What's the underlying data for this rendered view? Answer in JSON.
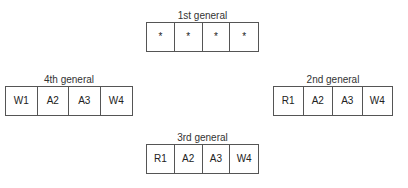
{
  "generals": [
    {
      "label": "1st general",
      "cells": [
        "*",
        "*",
        "*",
        "*"
      ]
    },
    {
      "label": "2nd general",
      "cells": [
        "R1",
        "A2",
        "A3",
        "W4"
      ]
    },
    {
      "label": "3rd general",
      "cells": [
        "R1",
        "A2",
        "A3",
        "W4"
      ]
    },
    {
      "label": "4th general",
      "cells": [
        "W1",
        "A2",
        "A3",
        "W4"
      ]
    }
  ]
}
